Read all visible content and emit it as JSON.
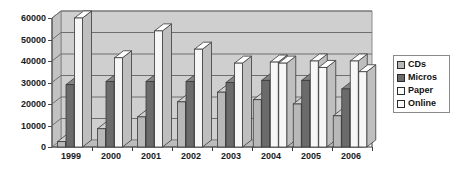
{
  "chart_data": {
    "type": "bar",
    "title": "",
    "subtitle": "",
    "xlabel": "",
    "ylabel": "",
    "categories": [
      "1999",
      "2000",
      "2001",
      "2002",
      "2003",
      "2004",
      "2005",
      "2006"
    ],
    "ylim": [
      0,
      60000
    ],
    "yticks": [
      0,
      10000,
      20000,
      30000,
      40000,
      50000,
      60000
    ],
    "ytick_labels": [
      "0",
      "10000",
      "20000",
      "30000",
      "40000",
      "50000",
      "60000"
    ],
    "grid": true,
    "three_d": true,
    "legend_position": "right",
    "series": [
      {
        "name": "CDs",
        "color": "#b8b8b8",
        "values": [
          2500,
          8500,
          14000,
          21000,
          25500,
          22000,
          20000,
          14500
        ]
      },
      {
        "name": "Micros",
        "color": "#6b6b6b",
        "values": [
          29000,
          30500,
          30500,
          30500,
          30000,
          31000,
          31000,
          27000
        ]
      },
      {
        "name": "Paper",
        "color": "#f7f7f7",
        "values": [
          60000,
          41500,
          54000,
          45500,
          39000,
          39500,
          40000,
          40000
        ]
      },
      {
        "name": "Online",
        "color": "#f7f7f7",
        "values": [
          null,
          null,
          null,
          null,
          null,
          39000,
          37000,
          35000
        ]
      }
    ]
  },
  "legend": {
    "items": [
      {
        "label": "CDs",
        "color": "#b8b8b8"
      },
      {
        "label": "Micros",
        "color": "#6b6b6b"
      },
      {
        "label": "Paper",
        "color": "#fbfbfb"
      },
      {
        "label": "Online",
        "color": "#fbfbfb"
      }
    ]
  },
  "colors": {
    "plot_background": "#d5d5d5",
    "back_wall": "#cfcfcf",
    "gridline": "#6e6e6e",
    "axis": "#4a4a4a",
    "text": "#1a1a1a",
    "page_background": "#ffffff"
  }
}
